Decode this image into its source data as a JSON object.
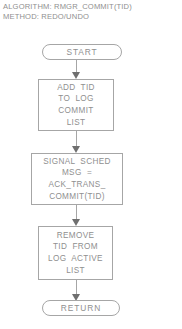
{
  "header": {
    "line1": "ALGORITHM: RMGR_COMMIT(TID)",
    "line2": "METHOD: REDO/UNDO"
  },
  "flowchart": {
    "title": "RMGR_COMMIT(TID) flowchart",
    "stroke_color": "#a6a6a6",
    "text_color": "#8f8f8f",
    "background_color": "#ffffff",
    "nodes": [
      {
        "id": "start",
        "type": "terminal",
        "label": "START"
      },
      {
        "id": "add-to-log-commit-list",
        "type": "process",
        "lines": [
          "ADD  TID",
          "TO  LOG",
          "COMMIT",
          "LIST"
        ]
      },
      {
        "id": "signal-sched",
        "type": "process",
        "lines": [
          "SIGNAL  SCHED",
          "MSG  =",
          "ACK_TRANS_",
          "COMMIT(TID)"
        ]
      },
      {
        "id": "remove-from-log-active-list",
        "type": "process",
        "lines": [
          "REMOVE",
          "TID  FROM",
          "LOG  ACTIVE",
          "LIST"
        ]
      },
      {
        "id": "return",
        "type": "terminal",
        "label": "RETURN"
      }
    ],
    "connectors": [
      {
        "id": "start-to-add",
        "from": "start",
        "to": "add-to-log-commit-list",
        "arrow": "down"
      },
      {
        "id": "add-to-signal",
        "from": "add-to-log-commit-list",
        "to": "signal-sched",
        "arrow": "down"
      },
      {
        "id": "signal-to-remove",
        "from": "signal-sched",
        "to": "remove-from-log-active-list",
        "arrow": "down"
      },
      {
        "id": "remove-to-return",
        "from": "remove-from-log-active-list",
        "to": "return",
        "arrow": "down"
      }
    ]
  }
}
